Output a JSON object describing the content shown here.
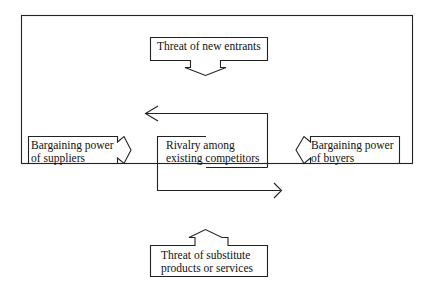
{
  "diagram": {
    "colors": {
      "line": "#222222",
      "background": "#ffffff"
    },
    "nodes": {
      "top": {
        "line1": "Threat of new entrants"
      },
      "left": {
        "line1": "Bargaining power",
        "line2": "of suppliers"
      },
      "center": {
        "line1": "Rivalry among",
        "line2": "existing competitors"
      },
      "right": {
        "line1": "Bargaining power",
        "line2": "of buyers"
      },
      "bottom": {
        "line1": "Threat of substitute",
        "line2": "products or services"
      }
    }
  }
}
